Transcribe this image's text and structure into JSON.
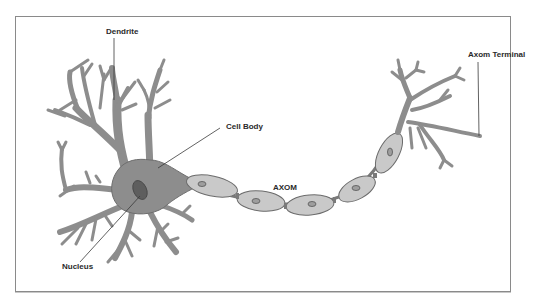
{
  "diagram": {
    "labels": {
      "dendrite": "Dendrite",
      "cell_body": "Cell Body",
      "axon": "AXOM",
      "axon_terminal": "Axom Terminal",
      "nucleus": "Nucleus"
    },
    "colors": {
      "neuron_body": "#8d8d8d",
      "nucleus": "#5e5e5e",
      "myelin_sheath": "#c9c9c9",
      "outline": "#6b6b6b",
      "frame_border": "#8a8a8a",
      "label_text": "#2a2a2a"
    },
    "myelin_segments": 6
  }
}
